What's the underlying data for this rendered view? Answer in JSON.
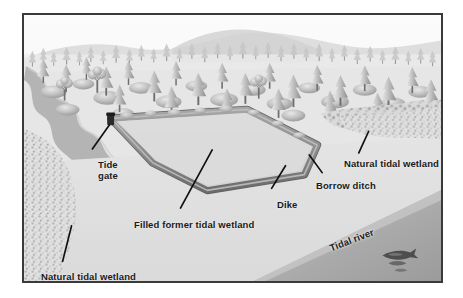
{
  "figure": {
    "medium": "grayscale perspective illustration",
    "border_color": "#3a3a3a",
    "background_color": "#ffffff"
  },
  "palette": {
    "sky": "#f4f4f4",
    "distant_hills": "#d8d8d8",
    "forest_light": "#e3e3e3",
    "forest_mid": "#bdbdbd",
    "forest_dark": "#8f8f8f",
    "marsh_flat": "#dcdcdc",
    "dike_crest": "#9a9a9a",
    "dike_shadow": "#6d6d6d",
    "impounded_fill": "#d5d5d5",
    "river_water": "#b0b0b0",
    "stream_water": "#a8a8a8",
    "label_text": "#1a1a1a",
    "leader_line": "#111111"
  },
  "labels": [
    {
      "id": "tide-gate",
      "text": "Tide gate",
      "lines": [
        "Tide",
        "gate"
      ]
    },
    {
      "id": "filled",
      "text": "Filled former tidal wetland",
      "lines": [
        "Filled former tidal wetland"
      ]
    },
    {
      "id": "dike",
      "text": "Dike",
      "lines": [
        "Dike"
      ]
    },
    {
      "id": "borrow",
      "text": "Borrow ditch",
      "lines": [
        "Borrow ditch"
      ]
    },
    {
      "id": "nat-right",
      "text": "Natural tidal wetland",
      "lines": [
        "Natural tidal wetland"
      ]
    },
    {
      "id": "nat-left",
      "text": "Natural tidal wetland",
      "lines": [
        "Natural tidal wetland"
      ]
    },
    {
      "id": "river",
      "text": "Tidal river",
      "lines": [
        "Tidal river"
      ]
    }
  ],
  "label_text": {
    "tide_gate_line1": "Tide",
    "tide_gate_line2": "gate",
    "filled_former_tidal_wetland": "Filled former tidal wetland",
    "dike": "Dike",
    "borrow_ditch": "Borrow ditch",
    "natural_tidal_wetland_right": "Natural tidal wetland",
    "natural_tidal_wetland_left": "Natural tidal wetland",
    "tidal_river": "Tidal river"
  },
  "scene_elements": {
    "forest": "coniferous forest band across upper third with scattered shrubs",
    "distant_hills": "low pale hills along the horizon",
    "stream": "winding tributary channel entering from upper left",
    "dike_polygon": "irregular pentagon enclosing the filled former tidal wetland",
    "tide_gate_marker": "dark structure at the northwest corner of the dike",
    "borrow_ditch": "narrow dark channel paralleling the outer toe of the dike",
    "marsh_vegetation_left": "stippled natural tidal marsh along the left margin",
    "marsh_vegetation_right": "stippled natural tidal marsh along the right margin",
    "tidal_river": "broad water body occupying the lower-right diagonal",
    "fish": "salmon shown in the tidal river at lower right"
  }
}
